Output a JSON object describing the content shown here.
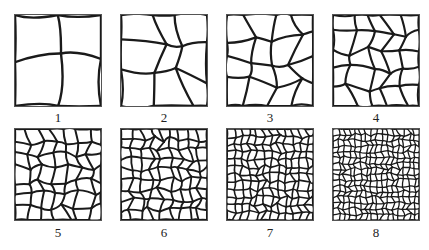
{
  "figure": {
    "panels": [
      {
        "label": "1",
        "grains_per_side": 2
      },
      {
        "label": "2",
        "grains_per_side": 3
      },
      {
        "label": "3",
        "grains_per_side": 4
      },
      {
        "label": "4",
        "grains_per_side": 5
      },
      {
        "label": "5",
        "grains_per_side": 7
      },
      {
        "label": "6",
        "grains_per_side": 9
      },
      {
        "label": "7",
        "grains_per_side": 12
      },
      {
        "label": "8",
        "grains_per_side": 16
      }
    ],
    "colors": {
      "boundary": "#1a1a1a",
      "frame": "#555555",
      "background": "#ffffff"
    }
  }
}
